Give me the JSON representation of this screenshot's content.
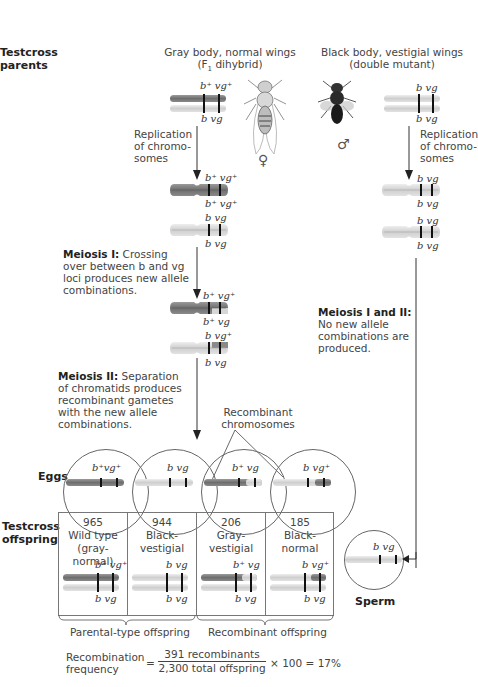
{
  "labels": {
    "testcross_parents": [
      "Testcross",
      "parents"
    ],
    "eggs": "Eggs",
    "testcross_offspring": [
      "Testcross",
      "offspring"
    ],
    "sperm": "Sperm"
  },
  "female_parent": {
    "title_line1": "Gray body, normal wings",
    "title_line2_pre": "(F",
    "title_line2_sub": "1",
    "title_line2_post": " dihybrid)",
    "symbol": "♀",
    "top_genes": "b⁺ vg⁺",
    "bottom_genes": "b  vg",
    "replication_label": [
      "Replication",
      "of chromo-",
      "somes"
    ],
    "replicated": [
      {
        "top": "b⁺ vg⁺",
        "bottom": "b⁺ vg⁺"
      },
      {
        "top": "b vg",
        "bottom": "b vg"
      }
    ],
    "meiosis1": {
      "bold": "Meiosis I:",
      "text": [
        "Crossing",
        "over between b and vg",
        "loci produces new allele",
        "combinations."
      ]
    },
    "crossed": [
      {
        "top": "b⁺ vg⁺",
        "bottom": "b⁺ vg"
      },
      {
        "top": "b vg⁺",
        "bottom": "b vg"
      }
    ],
    "meiosis2": {
      "bold": "Meiosis II:",
      "text": [
        "Separation",
        "of chromatids produces",
        "recombinant gametes",
        "with the new allele",
        "combinations."
      ]
    }
  },
  "male_parent": {
    "title_line1": "Black body, vestigial wings",
    "title_line2": "(double mutant)",
    "symbol": "♂",
    "top_genes": "b vg",
    "bottom_genes": "b vg",
    "replication_label": [
      "Replication",
      "of chromo-",
      "somes"
    ],
    "replicated": [
      {
        "top": "b vg",
        "bottom": "b vg"
      },
      {
        "top": "b vg",
        "bottom": "b vg"
      }
    ],
    "meiosis": {
      "bold": "Meiosis I and II:",
      "text": [
        "No new allele",
        "combinations are",
        "produced."
      ]
    }
  },
  "recombinant_label": [
    "Recombinant",
    "chromosomes"
  ],
  "eggs": [
    {
      "genes": "b⁺vg⁺",
      "color": "dark"
    },
    {
      "genes": "b  vg",
      "color": "light"
    },
    {
      "genes": "b⁺ vg",
      "color": "dark-light"
    },
    {
      "genes": "b vg⁺",
      "color": "light-dark"
    }
  ],
  "sperm": {
    "genes": "b vg"
  },
  "offspring": [
    {
      "count": "965",
      "phenotype": [
        "Wild type",
        "(gray-normal)"
      ],
      "top": "b⁺ vg⁺",
      "bottom": "b  vg"
    },
    {
      "count": "944",
      "phenotype": [
        "Black-",
        "vestigial"
      ],
      "top": "b  vg",
      "bottom": "b  vg"
    },
    {
      "count": "206",
      "phenotype": [
        "Gray-",
        "vestigial"
      ],
      "top": "b⁺ vg",
      "bottom": "b  vg"
    },
    {
      "count": "185",
      "phenotype": [
        "Black-",
        "normal"
      ],
      "top": "b  vg⁺",
      "bottom": "b  vg"
    }
  ],
  "groups": {
    "parental": "Parental-type offspring",
    "recombinant": "Recombinant offspring"
  },
  "formula": {
    "lhs": [
      "Recombination",
      "frequency"
    ],
    "eq": "=",
    "numerator": "391 recombinants",
    "denominator": "2,300 total offspring",
    "rhs": "× 100 = 17%"
  },
  "colors": {
    "dark_chromosome": "#7d7d7d",
    "light_chromosome": "#d6d6d6",
    "band": "#111111"
  }
}
